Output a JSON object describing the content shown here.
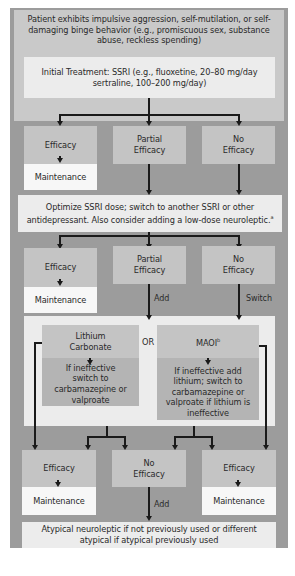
{
  "diagram": {
    "title_box": "Patient exhibits impulsive aggression, self-mutilation, or self-damaging binge behavior (e.g., promiscuous sex, substance abuse, reckless spending)",
    "initial_treatment": "Initial Treatment: SSRI (e.g., fluoxetine, 20–80 mg/day sertraline, 100–200 mg/day)",
    "row1": {
      "efficacy": "Efficacy",
      "maintenance": "Maintenance",
      "partial": "Partial Efficacy",
      "no": "No Efficacy"
    },
    "optimize": "Optimize SSRI dose; switch to another SSRI or other antidepressant. Also consider adding a low-dose neuroleptic.",
    "optimize_footnote": "a",
    "row2": {
      "efficacy": "Efficacy",
      "maintenance": "Maintenance",
      "partial": "Partial Efficacy",
      "no": "No Efficacy",
      "add_label": "Add",
      "switch_label": "Switch"
    },
    "or_panel": {
      "lithium": "Lithium Carbonate",
      "or_label": "OR",
      "maoi": "MAOI",
      "maoi_footnote": "b",
      "lithium_followup": "If ineffective switch to carbamazepine or valproate",
      "maoi_followup": "If ineffective add lithium; switch to carbamazepine or valproate if lithium is ineffective"
    },
    "row3": {
      "efficacy_left": "Efficacy",
      "maintenance_left": "Maintenance",
      "no": "No Efficacy",
      "efficacy_right": "Efficacy",
      "maintenance_right": "Maintenance",
      "add_label": "Add"
    },
    "final": "Atypical neuroleptic if not previously used or different atypical if atypical previously used"
  },
  "colors": {
    "frame": "#9c9c9c",
    "top_panel": "#c9c9c9",
    "box_gray": "#c4c4c4",
    "box_white": "#f7f7f7",
    "box_light": "#ececec",
    "line": "#1a1a1a"
  }
}
